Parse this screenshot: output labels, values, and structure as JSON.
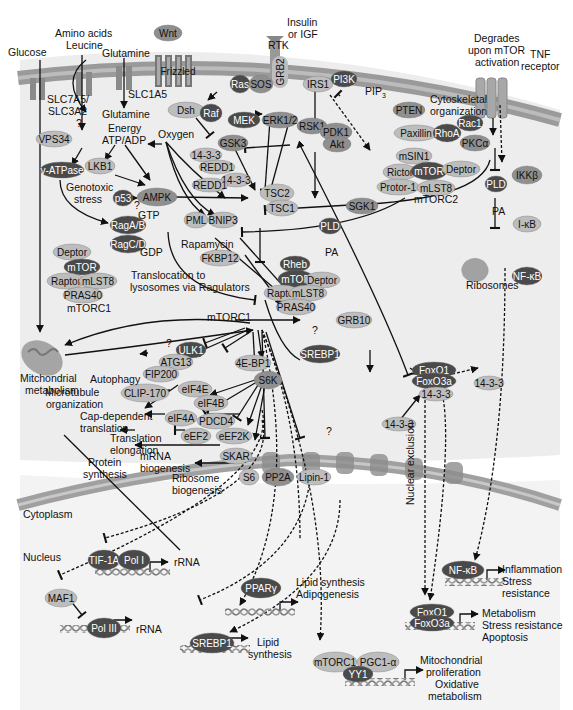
{
  "diagram_title": "mTOR signaling network",
  "colors": {
    "membrane": "#9a9a9a",
    "cytoplasm_bg": "#ececec",
    "nucleus_bg": "#f2f2f2",
    "node_light": "#bdbdbd",
    "node_mid": "#8f8f8f",
    "node_dark": "#4a4a4a",
    "text": "#111111"
  },
  "inputs": {
    "glucose": "Glucose",
    "amino_acids": "Amino acids",
    "leucine": "Leucine",
    "glutamine_out": "Glutamine",
    "glutamine_in": "Glutamine",
    "slc7a5": "SLC7A5/",
    "slc3a2": "SLC3A2",
    "slc1a5": "SLC1A5",
    "q1": "?",
    "wnt": "Wnt",
    "frizzled": "Frizzled",
    "rtk": "RTK",
    "insulin": "Insulin",
    "or_igf": "or IGF",
    "grb2": "GRB2",
    "degrades1": "Degrades",
    "degrades2": "upon mTOR",
    "degrades3": "activation",
    "tnf1": "TNF",
    "tnf2": "receptor"
  },
  "energy": {
    "energy": "Energy",
    "atp_adp": "ATP/ADP",
    "oxygen": "Oxygen",
    "genotoxic1": "Genotoxic",
    "genotoxic2": "stress",
    "q": "?",
    "gtp": "GTP",
    "gdp": "GDP",
    "transloc1": "Translocation to",
    "transloc2": "lysosomes via Ragulators",
    "rapamycin": "Rapamycin"
  },
  "nodes": {
    "vps34": "VPS34",
    "vatpase": "v-ATPase",
    "lkb1": "LKB1",
    "p53": "p53",
    "ampk": "AMPK",
    "raga": "RagA/B",
    "ragc": "RagC/D",
    "ras": "Ras",
    "sos": "SOS",
    "dsh": "Dsh",
    "raf": "Raf",
    "mek": "MEK",
    "erk": "ERK1/2",
    "rsk1": "RSK1",
    "irs1": "IRS1",
    "pi3k": "PI3K",
    "pip3": "PIP",
    "pip3_sub": "3",
    "pten": "PTEN",
    "gsk3": "GSK3",
    "f1433a": "14-3-3",
    "redd1a": "REDD1",
    "f1433b": "14-3-3",
    "redd1b": "REDD1",
    "tsc2": "TSC2",
    "tsc1": "TSC1",
    "pml": "PML",
    "bnip3": "BNIP3",
    "fkbp12": "FKBP12",
    "pdk1": "PDK1",
    "akt": "Akt",
    "sgk1": "SGK1",
    "pld1": "PLD",
    "pa1": "PA",
    "pld2": "PLD",
    "pa2": "PA",
    "ikkb": "IKKβ",
    "ikb": "I-κB",
    "nfkb": "NF-κB",
    "ribosomes": "Ribosomes",
    "grb10": "GRB10"
  },
  "mtorc1_inactive": {
    "deptor": "Deptor",
    "mtor": "mTOR",
    "raptor": "Raptor",
    "mlst8": "mLST8",
    "pras40": "PRAS40",
    "label": "mTORC1"
  },
  "mtorc1_active": {
    "rheb": "Rheb",
    "mtor": "mTOR",
    "deptor": "Deptor",
    "raptor": "Raptor",
    "mlst8": "mLST8",
    "pras40": "PRAS40",
    "label": "mTORC1"
  },
  "mtorc2": {
    "msin1": "mSIN1",
    "rictor": "Rictor",
    "mtor": "mTOR",
    "deptor": "Deptor",
    "protor": "Protor-1",
    "mlst8": "mLST8",
    "label": "mTORC2",
    "cyto1": "Cytoskeletal",
    "cyto2": "organization",
    "paxillin": "Paxillin",
    "rhoa": "RhoA",
    "rac1": "Rac1",
    "pkca": "PKCα"
  },
  "downstream": {
    "ulk1": "ULK1",
    "atg13": "ATG13",
    "fip200": "FIP200",
    "autophagy": "Autophagy",
    "mito1": "Mitchondrial",
    "mito2": "metabolism",
    "q_mito": "?",
    "ebp1": "4E-BP1",
    "srebp1": "SREBP1",
    "q_sre": "?",
    "s6k": "S6K",
    "clip170": "CLIP-170",
    "micro1": "Microtubule",
    "micro2": "organization",
    "eif4e": "eIF4E",
    "eif4b": "eIF4B",
    "eif4a": "eIF4A",
    "pdcd4": "PDCD4",
    "cap1": "Cap-dependent",
    "cap2": "translation",
    "eef2": "eEF2",
    "eef2k": "eEF2K",
    "tel1": "Translation",
    "tel2": "elongation",
    "skar": "SKAR",
    "mrna1": "mRNA",
    "mrna2": "biogenesis",
    "s6": "S6",
    "ribo1": "Ribosome",
    "ribo2": "biogenesis",
    "pp2a": "PP2A",
    "lipin1": "Lipin-1",
    "protein1": "Protein",
    "protein2": "synthesis",
    "q_mid": "?",
    "foxo1": "FoxO1",
    "foxo3a": "FoxO3a",
    "f1433c": "14-3-3",
    "f1433d": "14-3-3",
    "f1433e": "14-3-3",
    "nuclear_excl": "Nuclear exclusion"
  },
  "compartments": {
    "cytoplasm": "Cytoplasm",
    "nucleus": "Nucleus"
  },
  "nucleus": {
    "tif1a": "TIF-1A",
    "pol1": "Pol I",
    "rrna1": "rRNA",
    "maf1": "MAF1",
    "pol3": "Pol III",
    "rrna2": "rRNA",
    "ppar": "PPARγ",
    "lipid_syn": "Lipid synthesis",
    "adipo": "Adipogenesis",
    "srebp1": "SREBP1",
    "lipid1": "Lipid",
    "lipid2": "synthesis",
    "mtorc1": "mTORC1",
    "pgc1a": "PGC1-α",
    "yy1": "YY1",
    "mito1": "Mitochondrial",
    "mito2": "proliferation",
    "mito3": "Oxidative",
    "mito4": "metabolism",
    "nfkb": "NF-κB",
    "infl1": "Inflammation",
    "infl2": "Stress",
    "infl3": "resistance",
    "foxo1": "FoxO1",
    "foxo3a": "FoxO3a",
    "met1": "Metabolism",
    "met2": "Stress resistance",
    "met3": "Apoptosis"
  }
}
